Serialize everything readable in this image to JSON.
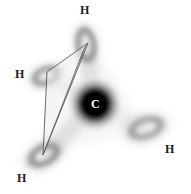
{
  "figure": {
    "name": "methane-tetrahedral-orbital-diagram",
    "width": 191,
    "height": 194,
    "background_color": "#ffffff"
  },
  "central_atom": {
    "symbol": "C",
    "name": "carbon",
    "label_color": "#ffffff",
    "core_color": "#000000",
    "halo_color": "#bdbdbd",
    "x": 95,
    "y": 104,
    "core_radius": 12,
    "halo_radius": 30
  },
  "hydrogens": [
    {
      "symbol": "H",
      "name": "hydrogen-top",
      "label_x": 80,
      "label_y": 4,
      "lobe_cx": 86,
      "lobe_cy": 45,
      "lobe_rx": 13,
      "lobe_ry": 23,
      "lobe_rotation": -8,
      "lobe_color": "#9a9a9a"
    },
    {
      "symbol": "H",
      "name": "hydrogen-left",
      "label_x": 15,
      "label_y": 68,
      "lobe_cx": 46,
      "lobe_cy": 76,
      "lobe_rx": 19,
      "lobe_ry": 12,
      "lobe_rotation": -22,
      "lobe_color": "#a5a5a5"
    },
    {
      "symbol": "H",
      "name": "hydrogen-bottom-left",
      "label_x": 17,
      "label_y": 172,
      "lobe_cx": 44,
      "lobe_cy": 155,
      "lobe_rx": 23,
      "lobe_ry": 14,
      "lobe_rotation": -28,
      "lobe_color": "#909090"
    },
    {
      "symbol": "H",
      "name": "hydrogen-bottom-right",
      "label_x": 165,
      "label_y": 143,
      "lobe_cx": 146,
      "lobe_cy": 128,
      "lobe_rx": 24,
      "lobe_ry": 14,
      "lobe_rotation": -18,
      "lobe_color": "#b4b4b4"
    }
  ],
  "wireframe": {
    "name": "tetrahedral-parallelogram",
    "stroke_color": "#555555",
    "fill_color": "#e8e8e8",
    "points": "88,43 47,72 43,155 84,49",
    "vertices": [
      {
        "x": 88,
        "y": 43
      },
      {
        "x": 47,
        "y": 72
      },
      {
        "x": 43,
        "y": 155
      },
      {
        "x": 84,
        "y": 49
      }
    ]
  },
  "shading": {
    "name": "tetrahedral-face-shading",
    "color": "#f0f0f0",
    "points": "88,45 150,128 44,154"
  }
}
